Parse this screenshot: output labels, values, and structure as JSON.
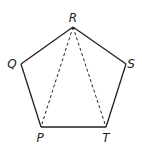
{
  "diagram": {
    "type": "pentagon-with-diagonals",
    "colors": {
      "stroke": "#231f20",
      "background": "#ffffff"
    },
    "vertices": [
      {
        "id": "R",
        "label": "R",
        "x": 73,
        "y": 27,
        "lx": 73,
        "ly": 22
      },
      {
        "id": "S",
        "label": "S",
        "x": 126,
        "y": 64,
        "lx": 131,
        "ly": 68
      },
      {
        "id": "T",
        "label": "T",
        "x": 106,
        "y": 127,
        "lx": 106,
        "ly": 142
      },
      {
        "id": "P",
        "label": "P",
        "x": 41,
        "y": 127,
        "lx": 40,
        "ly": 142
      },
      {
        "id": "Q",
        "label": "Q",
        "x": 21,
        "y": 64,
        "lx": 12,
        "ly": 68
      }
    ],
    "edges": [
      [
        "R",
        "S"
      ],
      [
        "S",
        "T"
      ],
      [
        "T",
        "P"
      ],
      [
        "P",
        "Q"
      ],
      [
        "Q",
        "R"
      ]
    ],
    "dashed_diagonals": [
      [
        "R",
        "P"
      ],
      [
        "R",
        "T"
      ]
    ]
  }
}
